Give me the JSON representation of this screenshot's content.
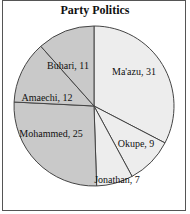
{
  "chart_data": {
    "type": "pie",
    "title": "Party Politics",
    "categories": [
      "Ma'azu",
      "Okupe",
      "Jonathan",
      "Mohammed",
      "Amaechi",
      "Buhari"
    ],
    "values": [
      31,
      9,
      7,
      25,
      12,
      11
    ],
    "labels": [
      "Ma'azu, 31",
      "Okupe, 9",
      "Jonathan, 7",
      "Mohammed, 25",
      "Amaechi, 12",
      "Buhari, 11"
    ],
    "colors": [
      "#ededed",
      "#ededed",
      "#ededed",
      "#c9c9c9",
      "#c9c9c9",
      "#c9c9c9"
    ],
    "start_angle": "12 o'clock",
    "direction": "clockwise",
    "legend": "none"
  }
}
